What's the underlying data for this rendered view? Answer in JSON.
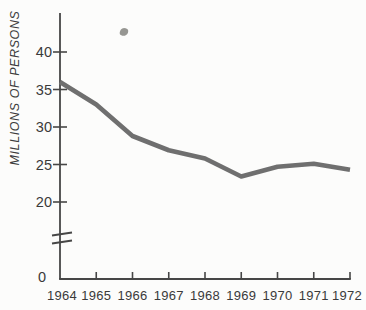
{
  "figure": {
    "background_color": "#fcfcfb",
    "artifact": {
      "name": "ink-spot",
      "color": "#84847f"
    }
  },
  "chart_data": {
    "type": "line",
    "title": "",
    "xlabel": "",
    "ylabel": "MILLIONS OF PERSONS",
    "categories": [
      "1964",
      "1965",
      "1966",
      "1967",
      "1968",
      "1969",
      "1970",
      "1971",
      "1972"
    ],
    "series": [
      {
        "name": "persons",
        "values": [
          36.0,
          33.0,
          28.8,
          26.9,
          25.8,
          23.4,
          24.7,
          25.1,
          24.3
        ]
      }
    ],
    "y_ticks": [
      40,
      35,
      30,
      25,
      20
    ],
    "origin_label": "0",
    "axis_break": true,
    "y_axis_displayed_range": [
      20,
      42.5
    ],
    "grid": false,
    "legend": false,
    "line_color": "#6f6f6f",
    "axis_color": "#464646",
    "label_color": "#3a3a3a"
  }
}
